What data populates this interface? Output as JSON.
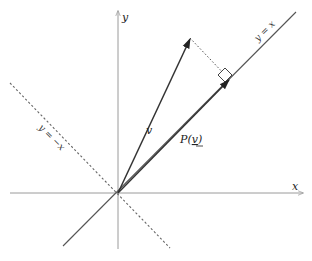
{
  "diagram": {
    "axes": {
      "x_label": "x",
      "y_label": "y"
    },
    "lines": {
      "diag_pos_label": "y = x",
      "diag_neg_label": "y = −x"
    },
    "vectors": {
      "v_label": "v",
      "proj_label_prefix": "P(",
      "proj_label_arg": "v",
      "proj_label_suffix": ")"
    },
    "geometry": {
      "origin": [
        118,
        193
      ],
      "v_tip": [
        190,
        38
      ],
      "proj_tip": [
        229,
        80
      ]
    },
    "colors": {
      "axis": "#9a9a9a",
      "vector": "#333333",
      "line": "#555555",
      "background": "#ffffff"
    }
  }
}
